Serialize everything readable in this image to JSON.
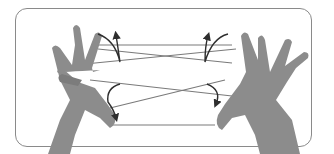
{
  "figure": {
    "colors": {
      "frame_border": "#8a8a8a",
      "skin": "#8c8c8c",
      "skin_shadow": "#6e6e6e",
      "string": "#7a7a7a",
      "arrow": "#2e2e2e",
      "background": "#ffffff"
    },
    "arrows": [
      {
        "position": "left-index",
        "direction": "counterclockwise"
      },
      {
        "position": "right-index",
        "direction": "clockwise"
      },
      {
        "position": "left-thumb",
        "direction": "clockwise"
      },
      {
        "position": "right-thumb",
        "direction": "counterclockwise"
      }
    ]
  }
}
